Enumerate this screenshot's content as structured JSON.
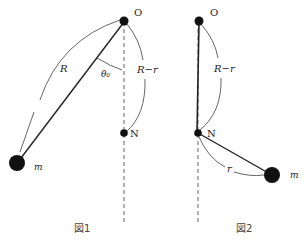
{
  "figure1": {
    "caption": "図1",
    "pivot_label": "O",
    "nail_label": "N",
    "mass_label": "m",
    "string_length_label": "R",
    "remaining_length_label": "R−r",
    "angle_label": "θ₀"
  },
  "figure2": {
    "caption": "図2",
    "pivot_label": "O",
    "nail_label": "N",
    "mass_label": "m",
    "remaining_length_label": "R−r",
    "short_length_label": "r"
  },
  "colors": {
    "line": "#222222",
    "arc": "#555555",
    "dashed": "#666666"
  }
}
